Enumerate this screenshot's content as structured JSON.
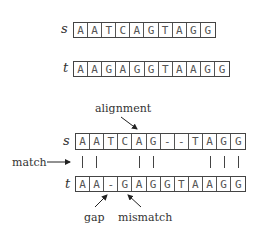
{
  "cell_width": 14.2,
  "sequences": {
    "s": {
      "label": "s",
      "letters": [
        "A",
        "A",
        "T",
        "C",
        "A",
        "G",
        "T",
        "A",
        "G",
        "G"
      ],
      "x": 73,
      "y": 22,
      "h": 16,
      "label_x": 61
    },
    "t": {
      "label": "t",
      "letters": [
        "A",
        "A",
        "G",
        "A",
        "G",
        "G",
        "T",
        "A",
        "A",
        "G",
        "G"
      ],
      "x": 73,
      "y": 61,
      "h": 16,
      "label_x": 63
    }
  },
  "alignment": {
    "s": {
      "label": "s",
      "letters": [
        "A",
        "A",
        "T",
        "C",
        "A",
        "G",
        "-",
        "-",
        "T",
        "A",
        "G",
        "G"
      ],
      "x": 75,
      "y": 133,
      "h": 17,
      "label_x": 63
    },
    "t": {
      "label": "t",
      "letters": [
        "A",
        "A",
        "-",
        "G",
        "A",
        "G",
        "G",
        "T",
        "A",
        "A",
        "G",
        "G"
      ],
      "x": 75,
      "y": 176,
      "h": 16,
      "label_x": 65
    },
    "match_columns": [
      0,
      1,
      4,
      5,
      9,
      10,
      11
    ],
    "bar_top": 156,
    "bar_bottom": 168
  },
  "annotations": {
    "alignment_label": "alignment",
    "match_label": "match",
    "gap_label": "gap",
    "mismatch_label": "mismatch"
  }
}
